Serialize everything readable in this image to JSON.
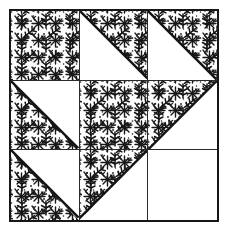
{
  "figure": {
    "background_color": "#ffffff",
    "outline_color": "#171717",
    "grid_line_color": "#2a2a2a",
    "fabrics": [
      {
        "name": "print",
        "label": "printed calico",
        "color": "#151515",
        "ground": "#fdfdfd"
      },
      {
        "name": "plain",
        "label": "plain white",
        "color": "#ffffff"
      }
    ]
  },
  "block": {
    "rows": 3,
    "columns": 3,
    "cells": [
      {
        "row": 1,
        "col": 1,
        "unit": "square",
        "fill": "print",
        "diagonal": "none",
        "print_half": "full"
      },
      {
        "row": 1,
        "col": 2,
        "unit": "triangle",
        "fill": "half",
        "diagonal": "tl-br",
        "print_half": "upper-right"
      },
      {
        "row": 1,
        "col": 3,
        "unit": "triangle",
        "fill": "half",
        "diagonal": "tl-br",
        "print_half": "upper-right"
      },
      {
        "row": 2,
        "col": 1,
        "unit": "triangle",
        "fill": "half",
        "diagonal": "tl-br",
        "print_half": "lower-left"
      },
      {
        "row": 2,
        "col": 2,
        "unit": "square",
        "fill": "print",
        "diagonal": "none",
        "print_half": "full"
      },
      {
        "row": 2,
        "col": 3,
        "unit": "triangle",
        "fill": "half",
        "diagonal": "tr-bl",
        "print_half": "upper-left"
      },
      {
        "row": 3,
        "col": 1,
        "unit": "triangle",
        "fill": "half",
        "diagonal": "tl-br",
        "print_half": "lower-left"
      },
      {
        "row": 3,
        "col": 2,
        "unit": "triangle",
        "fill": "half",
        "diagonal": "tr-bl",
        "print_half": "upper-left"
      },
      {
        "row": 3,
        "col": 3,
        "unit": "square",
        "fill": "plain",
        "diagonal": "none",
        "print_half": "none"
      }
    ]
  }
}
